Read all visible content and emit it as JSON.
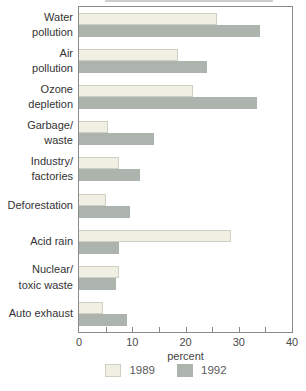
{
  "colors": {
    "background": "#FFFFFF",
    "axis": "#8A8A8A",
    "category_label_text": "#333333",
    "tick_label_text": "#4A4A4A",
    "legend_text": "#5A5A5A",
    "series_1989_fill": "#EFEFE4",
    "series_1989_border": "#CFCFC3",
    "series_1992_fill": "#ADB3AD"
  },
  "chart_data": {
    "type": "bar",
    "orientation": "horizontal",
    "title": "",
    "xlabel": "percent",
    "ylabel": "",
    "xlim": [
      0,
      40
    ],
    "x_major_ticks": [
      0,
      10,
      20,
      30,
      40
    ],
    "x_minor_ticks": [
      5,
      10,
      15,
      20,
      25,
      30,
      35
    ],
    "grid": false,
    "legend_position": "bottom",
    "categories": [
      "Water pollution",
      "Air pollution",
      "Ozone depletion",
      "Garbage/waste",
      "Industry/factories",
      "Deforestation",
      "Acid rain",
      "Nuclear/toxic waste",
      "Auto exhaust"
    ],
    "category_label_lines": [
      [
        "Water",
        "pollution"
      ],
      [
        "Air",
        "pollution"
      ],
      [
        "Ozone",
        "depletion"
      ],
      [
        "Garbage/",
        "waste"
      ],
      [
        "Industry/",
        "factories"
      ],
      [
        "Deforestation"
      ],
      [
        "Acid rain"
      ],
      [
        "Nuclear/",
        "toxic waste"
      ],
      [
        "Auto exhaust"
      ]
    ],
    "series": [
      {
        "name": "1989",
        "values": [
          26,
          18.5,
          21.5,
          5.5,
          7.5,
          5,
          28.5,
          7.5,
          4.5
        ]
      },
      {
        "name": "1992",
        "values": [
          34,
          24,
          33.5,
          14,
          11.5,
          9.5,
          7.5,
          7,
          9
        ]
      }
    ]
  }
}
